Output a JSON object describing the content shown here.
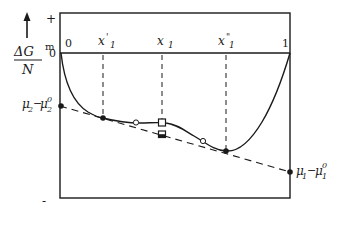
{
  "figure": {
    "y_axis": {
      "label_numerator": "ΔG",
      "label_superscript": "m",
      "label_denominator": "N",
      "plus_sign": "+",
      "zero_label": "0",
      "minus_sign": "-"
    },
    "x_axis": {
      "left_label": "0",
      "right_label": "1",
      "markers": [
        {
          "name": "x'1",
          "base": "x",
          "prime": "'",
          "sub": "1"
        },
        {
          "name": "x1",
          "base": "x",
          "prime": "",
          "sub": "1"
        },
        {
          "name": "x''1",
          "base": "x",
          "prime": "\"",
          "sub": "1"
        }
      ]
    },
    "intercepts": {
      "left": {
        "mu": "μ",
        "sub": "2",
        "minus": "−",
        "mu0": "μ",
        "sub0": "2",
        "sup0": "0"
      },
      "right": {
        "mu": "μ",
        "sub": "1",
        "minus": "−",
        "mu0": "μ",
        "sub0": "1",
        "sup0": "0"
      }
    },
    "colors": {
      "line": "#1a1a1a",
      "background": "#ffffff"
    }
  }
}
